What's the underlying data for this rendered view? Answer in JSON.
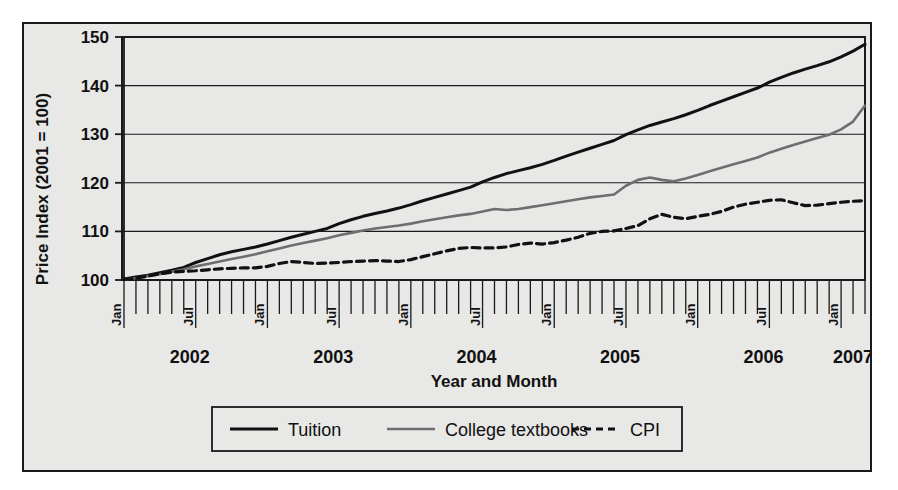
{
  "chart_data": {
    "type": "line",
    "title": "",
    "xlabel": "Year and Month",
    "ylabel": "Price Index (2001 = 100)",
    "ylim": [
      100,
      150
    ],
    "yticks": [
      100,
      110,
      120,
      130,
      140,
      150
    ],
    "grid": true,
    "legend_position": "bottom",
    "x_start": "Jan 2002",
    "x_end": "Mar 2007",
    "x_month_labels": [
      "Jan",
      "Jul"
    ],
    "year_labels": [
      "2002",
      "2003",
      "2004",
      "2005",
      "2006",
      "2007"
    ],
    "x": [
      "2002-01",
      "2002-02",
      "2002-03",
      "2002-04",
      "2002-05",
      "2002-06",
      "2002-07",
      "2002-08",
      "2002-09",
      "2002-10",
      "2002-11",
      "2002-12",
      "2003-01",
      "2003-02",
      "2003-03",
      "2003-04",
      "2003-05",
      "2003-06",
      "2003-07",
      "2003-08",
      "2003-09",
      "2003-10",
      "2003-11",
      "2003-12",
      "2004-01",
      "2004-02",
      "2004-03",
      "2004-04",
      "2004-05",
      "2004-06",
      "2004-07",
      "2004-08",
      "2004-09",
      "2004-10",
      "2004-11",
      "2004-12",
      "2005-01",
      "2005-02",
      "2005-03",
      "2005-04",
      "2005-05",
      "2005-06",
      "2005-07",
      "2005-08",
      "2005-09",
      "2005-10",
      "2005-11",
      "2005-12",
      "2006-01",
      "2006-02",
      "2006-03",
      "2006-04",
      "2006-05",
      "2006-06",
      "2006-07",
      "2006-08",
      "2006-09",
      "2006-10",
      "2006-11",
      "2006-12",
      "2007-01",
      "2007-02",
      "2007-03"
    ],
    "series": [
      {
        "name": "Tuition",
        "color": "#111111",
        "style": "solid",
        "values": [
          100.2,
          100.6,
          101.0,
          101.5,
          102.0,
          102.6,
          103.6,
          104.4,
          105.2,
          105.8,
          106.3,
          106.8,
          107.4,
          108.1,
          108.8,
          109.4,
          110.0,
          110.6,
          111.6,
          112.4,
          113.1,
          113.7,
          114.2,
          114.8,
          115.5,
          116.3,
          117.0,
          117.7,
          118.4,
          119.1,
          120.2,
          121.1,
          121.9,
          122.5,
          123.1,
          123.8,
          124.6,
          125.5,
          126.3,
          127.1,
          127.9,
          128.7,
          129.9,
          130.9,
          131.8,
          132.5,
          133.2,
          134.0,
          134.9,
          135.9,
          136.8,
          137.7,
          138.6,
          139.5,
          140.7,
          141.7,
          142.6,
          143.4,
          144.1,
          144.9,
          145.9,
          147.1,
          148.5
        ]
      },
      {
        "name": "College textbooks",
        "color": "#6e6e6e",
        "style": "solid",
        "values": [
          100.1,
          100.4,
          100.8,
          101.2,
          101.7,
          102.2,
          102.8,
          103.3,
          103.8,
          104.3,
          104.8,
          105.3,
          105.9,
          106.5,
          107.1,
          107.6,
          108.1,
          108.6,
          109.2,
          109.7,
          110.2,
          110.6,
          110.9,
          111.2,
          111.6,
          112.1,
          112.5,
          112.9,
          113.3,
          113.6,
          114.1,
          114.6,
          114.4,
          114.6,
          115.0,
          115.4,
          115.8,
          116.2,
          116.6,
          117.0,
          117.3,
          117.6,
          119.4,
          120.6,
          121.1,
          120.6,
          120.3,
          120.9,
          121.6,
          122.4,
          123.1,
          123.8,
          124.5,
          125.2,
          126.2,
          127.0,
          127.8,
          128.5,
          129.2,
          129.9,
          131.0,
          132.6,
          135.9
        ]
      },
      {
        "name": "CPI",
        "color": "#111111",
        "style": "dashed",
        "values": [
          100.1,
          100.4,
          100.8,
          101.3,
          101.6,
          101.8,
          101.9,
          102.1,
          102.3,
          102.4,
          102.5,
          102.5,
          102.8,
          103.4,
          103.8,
          103.6,
          103.4,
          103.5,
          103.6,
          103.8,
          103.9,
          104.0,
          103.9,
          103.8,
          104.2,
          104.8,
          105.4,
          106.0,
          106.5,
          106.7,
          106.6,
          106.6,
          106.8,
          107.3,
          107.6,
          107.4,
          107.7,
          108.2,
          108.8,
          109.6,
          110.0,
          110.1,
          110.6,
          111.2,
          112.6,
          113.5,
          112.9,
          112.6,
          113.1,
          113.5,
          114.1,
          115.0,
          115.6,
          116.0,
          116.4,
          116.5,
          115.9,
          115.3,
          115.4,
          115.7,
          116.0,
          116.2,
          116.3
        ]
      }
    ]
  },
  "legend": {
    "items": [
      {
        "label": "Tuition"
      },
      {
        "label": "College textbooks"
      },
      {
        "label": "CPI"
      }
    ]
  }
}
